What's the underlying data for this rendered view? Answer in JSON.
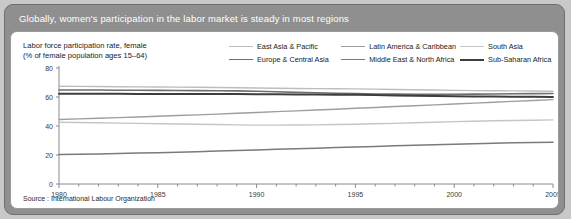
{
  "header": {
    "title": "Globally, women's participation in the labor market is steady in most regions"
  },
  "source": {
    "text": "Source : International Labour Organization"
  },
  "colors": {
    "page_background": "#c8c8c8",
    "figure_background": "#8f8f8f",
    "panel_background": "#ffffff",
    "header_text": "#ffffff",
    "axis": "#8a8a8a",
    "text": "#1a1a1a"
  },
  "chart_data": {
    "type": "line",
    "title": "Labor force participation rate, female (% of female population ages 15–64)",
    "axis_caption_line1": "Labor force participation rate, female",
    "axis_caption_line2": "(% of female population ages 15–64)",
    "xlabel": "",
    "ylabel": "",
    "xlim": [
      1980,
      2005
    ],
    "ylim": [
      0,
      80
    ],
    "yticks": [
      0,
      20,
      40,
      60,
      80
    ],
    "ytick_labels": [
      "0",
      "20",
      "40",
      "60",
      "80"
    ],
    "xticks": [
      1980,
      1985,
      1990,
      1995,
      2000,
      2005
    ],
    "xtick_labels": [
      "1980",
      "1985",
      "1990",
      "1995",
      "2000",
      "2005"
    ],
    "minor_xtick_interval": 1,
    "grid": false,
    "legend_position": "top-right",
    "x": [
      1980,
      1981,
      1982,
      1983,
      1984,
      1985,
      1986,
      1987,
      1988,
      1989,
      1990,
      1991,
      1992,
      1993,
      1994,
      1995,
      1996,
      1997,
      1998,
      1999,
      2000,
      2001,
      2002,
      2003,
      2004,
      2005
    ],
    "series": [
      {
        "name": "East Asia & Pacific",
        "color": "#bdbdbd",
        "width": 1.4,
        "values": [
          67.4,
          67.3,
          67.2,
          67.1,
          67.0,
          66.9,
          66.8,
          66.7,
          66.6,
          66.4,
          66.2,
          66.0,
          65.9,
          65.8,
          65.7,
          65.6,
          65.4,
          65.2,
          65.0,
          64.8,
          64.6,
          64.4,
          64.3,
          64.2,
          64.1,
          64.0
        ]
      },
      {
        "name": "Europe & Central Asia",
        "color": "#6e6e6e",
        "width": 1.6,
        "values": [
          64.8,
          64.8,
          64.8,
          64.7,
          64.7,
          64.6,
          64.5,
          64.4,
          64.3,
          64.2,
          64.0,
          63.6,
          63.2,
          62.9,
          62.6,
          62.3,
          62.1,
          62.0,
          61.9,
          61.9,
          61.9,
          62.0,
          62.1,
          62.2,
          62.3,
          62.4
        ]
      },
      {
        "name": "Latin America & Caribbean",
        "color": "#9e9e9e",
        "width": 1.4,
        "values": [
          44.5,
          44.9,
          45.3,
          45.8,
          46.2,
          46.7,
          47.2,
          47.7,
          48.2,
          48.8,
          49.3,
          49.9,
          50.4,
          51.0,
          51.6,
          52.2,
          52.8,
          53.4,
          54.0,
          54.6,
          55.2,
          55.8,
          56.4,
          57.0,
          57.6,
          58.2
        ]
      },
      {
        "name": "Middle East & North Africa",
        "color": "#7a7a7a",
        "width": 1.5,
        "values": [
          20.3,
          20.5,
          20.7,
          21.0,
          21.3,
          21.6,
          21.9,
          22.3,
          22.7,
          23.1,
          23.5,
          23.9,
          24.3,
          24.7,
          25.1,
          25.5,
          25.9,
          26.3,
          26.7,
          27.1,
          27.5,
          27.8,
          28.1,
          28.4,
          28.6,
          28.8
        ]
      },
      {
        "name": "South Asia",
        "color": "#c5c5c5",
        "width": 1.4,
        "values": [
          42.6,
          42.4,
          42.2,
          42.0,
          41.8,
          41.6,
          41.4,
          41.2,
          41.0,
          40.8,
          40.6,
          40.6,
          40.7,
          40.8,
          41.0,
          41.2,
          41.5,
          41.8,
          42.2,
          42.6,
          43.0,
          43.3,
          43.6,
          43.8,
          44.0,
          44.2
        ]
      },
      {
        "name": "Sub-Saharan Africa",
        "color": "#3d3d3d",
        "width": 2.0,
        "values": [
          62.2,
          62.2,
          62.2,
          62.2,
          62.1,
          62.1,
          62.1,
          62.0,
          62.0,
          62.0,
          61.9,
          61.9,
          61.8,
          61.7,
          61.6,
          61.5,
          61.3,
          61.1,
          60.9,
          60.7,
          60.5,
          60.4,
          60.3,
          60.2,
          60.1,
          60.0
        ]
      }
    ],
    "legend_order": [
      "East Asia & Pacific",
      "Latin America & Caribbean",
      "South Asia",
      "Europe & Central Asia",
      "Middle East & North Africa",
      "Sub-Saharan Africa"
    ]
  }
}
